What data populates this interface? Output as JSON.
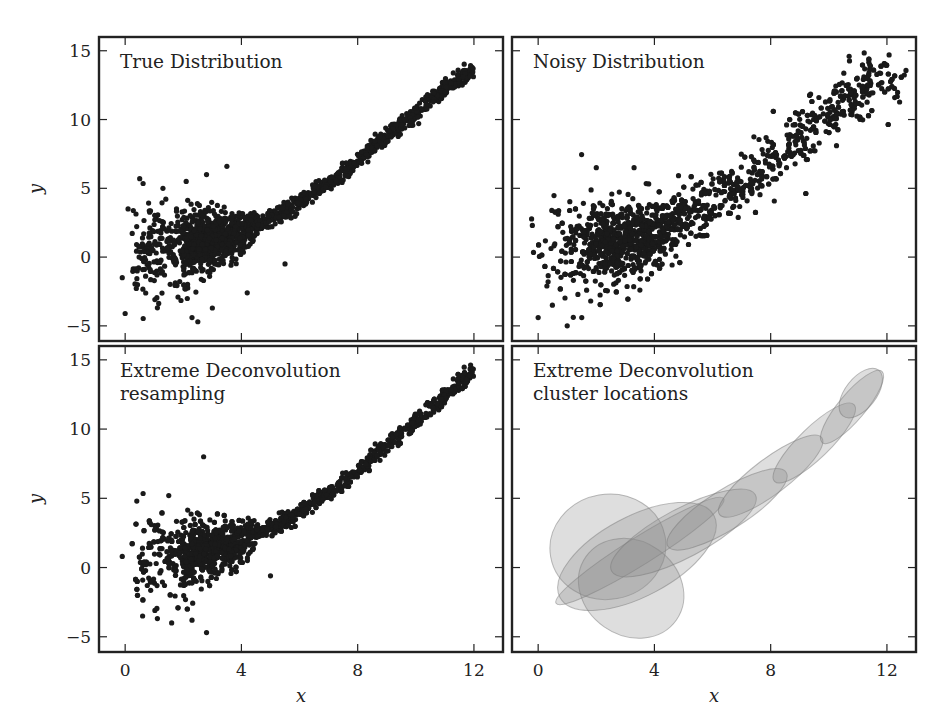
{
  "figure": {
    "xlabel": "x",
    "ylabel": "y",
    "xticks": [
      0,
      4,
      8,
      12
    ],
    "yticks": [
      -5,
      0,
      5,
      10,
      15
    ],
    "xlim": [
      -0.9,
      13.0
    ],
    "ylim": [
      -6.1,
      16.0
    ]
  },
  "chart_data": [
    {
      "type": "scatter",
      "title": "True Distribution",
      "panel": "top-left",
      "xlabel": "",
      "ylabel": "y",
      "xlim": [
        -0.9,
        13.0
      ],
      "ylim": [
        -6.1,
        16.0
      ],
      "description": "Points follow a curved relation y ≈ f(x), tight along curve for x>4, widely scattered near x=0–4",
      "curve": [
        [
          1,
          0.5
        ],
        [
          2,
          0.8
        ],
        [
          3,
          1.2
        ],
        [
          4,
          1.8
        ],
        [
          5,
          2.8
        ],
        [
          6,
          4.0
        ],
        [
          7,
          5.4
        ],
        [
          8,
          7.0
        ],
        [
          9,
          8.8
        ],
        [
          10,
          10.5
        ],
        [
          11,
          12.2
        ],
        [
          11.8,
          13.4
        ]
      ],
      "outliers": [
        [
          -0.1,
          -1.5
        ],
        [
          0,
          -4.1
        ],
        [
          0.1,
          3.5
        ],
        [
          0.5,
          5.7
        ],
        [
          1.3,
          5.0
        ],
        [
          2.1,
          5.5
        ],
        [
          2.8,
          6.0
        ],
        [
          3.5,
          6.6
        ],
        [
          2.3,
          -4.4
        ],
        [
          2.5,
          -4.7
        ],
        [
          3.0,
          -3.7
        ],
        [
          4.2,
          -2.6
        ],
        [
          5.5,
          -0.5
        ]
      ]
    },
    {
      "type": "scatter",
      "title": "Noisy Distribution",
      "panel": "top-right",
      "xlabel": "",
      "ylabel": "",
      "xlim": [
        -0.9,
        13.0
      ],
      "ylim": [
        -6.1,
        16.0
      ],
      "description": "Same relation with added measurement noise; broader band around the curve",
      "curve": [
        [
          1,
          0.5
        ],
        [
          2,
          0.8
        ],
        [
          3,
          1.2
        ],
        [
          4,
          1.8
        ],
        [
          5,
          2.8
        ],
        [
          6,
          4.0
        ],
        [
          7,
          5.4
        ],
        [
          8,
          7.0
        ],
        [
          9,
          8.8
        ],
        [
          10,
          10.5
        ],
        [
          11,
          12.2
        ],
        [
          12.3,
          13.3
        ]
      ],
      "band_halfwidth": 1.2,
      "outliers": [
        [
          -0.2,
          2.3
        ],
        [
          0,
          -4.4
        ],
        [
          0.3,
          -2.1
        ],
        [
          1.0,
          -5.0
        ],
        [
          1.5,
          -4.4
        ],
        [
          2.0,
          6.5
        ],
        [
          3.3,
          6.5
        ],
        [
          3.5,
          -2.4
        ],
        [
          10.7,
          14.6
        ]
      ]
    },
    {
      "type": "scatter",
      "title": "Extreme Deconvolution\nresampling",
      "panel": "bottom-left",
      "xlabel": "x",
      "ylabel": "y",
      "xlim": [
        -0.9,
        13.0
      ],
      "ylim": [
        -6.1,
        16.0
      ],
      "description": "Resampled points from the XD mixture model, resembling the true distribution",
      "curve": [
        [
          1,
          0.5
        ],
        [
          2,
          0.8
        ],
        [
          3,
          1.3
        ],
        [
          4,
          2.0
        ],
        [
          5,
          2.9
        ],
        [
          6,
          4.0
        ],
        [
          7,
          5.4
        ],
        [
          8,
          7.0
        ],
        [
          9,
          8.8
        ],
        [
          10,
          10.6
        ],
        [
          11,
          12.3
        ],
        [
          11.9,
          14.1
        ]
      ],
      "outliers": [
        [
          -0.1,
          0.8
        ],
        [
          0.4,
          4.8
        ],
        [
          1.5,
          5.2
        ],
        [
          2.7,
          8.0
        ],
        [
          0.6,
          -3.5
        ],
        [
          1.6,
          -4.0
        ],
        [
          2.3,
          -3.8
        ],
        [
          2.8,
          -4.7
        ],
        [
          5.0,
          -0.6
        ]
      ]
    },
    {
      "type": "ellipses",
      "title": "Extreme Deconvolution\ncluster locations",
      "panel": "bottom-right",
      "xlabel": "x",
      "ylabel": "",
      "xlim": [
        -0.9,
        13.0
      ],
      "ylim": [
        -6.1,
        16.0
      ],
      "description": "Gaussian mixture components drawn as translucent gray ellipses",
      "ellipses": [
        {
          "cx": 2.4,
          "cy": 1.5,
          "rx": 2.0,
          "ry": 3.8,
          "angle": -10
        },
        {
          "cx": 3.2,
          "cy": -1.5,
          "rx": 1.9,
          "ry": 3.4,
          "angle": 35
        },
        {
          "cx": 3.5,
          "cy": 1.2,
          "rx": 3.4,
          "ry": 1.0,
          "angle": -32
        },
        {
          "cx": 3.4,
          "cy": 0.8,
          "rx": 3.0,
          "ry": 0.9,
          "angle": -28
        },
        {
          "cx": 5.0,
          "cy": 2.5,
          "rx": 2.8,
          "ry": 0.55,
          "angle": -28
        },
        {
          "cx": 6.5,
          "cy": 4.2,
          "rx": 2.4,
          "ry": 0.45,
          "angle": -32
        },
        {
          "cx": 8.0,
          "cy": 6.6,
          "rx": 2.2,
          "ry": 0.4,
          "angle": -37
        },
        {
          "cx": 9.5,
          "cy": 9.0,
          "rx": 1.9,
          "ry": 0.35,
          "angle": -44
        },
        {
          "cx": 10.8,
          "cy": 11.6,
          "rx": 1.6,
          "ry": 0.3,
          "angle": -50
        },
        {
          "cx": 11.1,
          "cy": 12.6,
          "rx": 1.0,
          "ry": 0.35,
          "angle": -52
        }
      ]
    }
  ]
}
